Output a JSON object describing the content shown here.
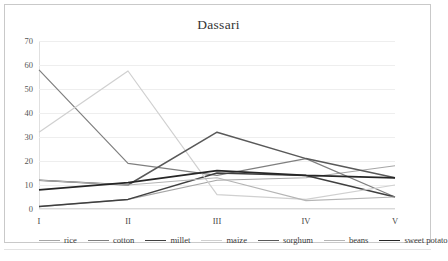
{
  "chart_data": {
    "type": "line",
    "title": "Dassari",
    "xlabel": "",
    "ylabel": "",
    "categories": [
      "I",
      "II",
      "III",
      "IV",
      "V"
    ],
    "ylim": [
      0,
      70
    ],
    "yticks": [
      0,
      10,
      20,
      30,
      40,
      50,
      60,
      70
    ],
    "grid": true,
    "legend_position": "bottom",
    "series": [
      {
        "name": "rice",
        "color": "#a6a6a6",
        "width": 1.1,
        "values": [
          1,
          4,
          12,
          13,
          18
        ]
      },
      {
        "name": "cotton",
        "color": "#7f7f7f",
        "width": 1.2,
        "values": [
          58,
          19,
          14,
          21,
          5
        ]
      },
      {
        "name": "millet",
        "color": "#404040",
        "width": 1.5,
        "values": [
          1,
          4,
          15,
          14,
          5
        ]
      },
      {
        "name": "maize",
        "color": "#d0d0d0",
        "width": 1.2,
        "values": [
          32,
          57.5,
          6,
          4,
          10
        ]
      },
      {
        "name": "sorghum",
        "color": "#595959",
        "width": 1.5,
        "values": [
          12,
          10,
          32,
          21,
          13
        ]
      },
      {
        "name": "beans",
        "color": "#b5b5b5",
        "width": 1.1,
        "values": [
          12,
          10,
          13,
          3.5,
          5
        ]
      },
      {
        "name": "sweet potato",
        "color": "#262626",
        "width": 1.7,
        "values": [
          8,
          11,
          16,
          14,
          13
        ]
      }
    ]
  },
  "legend": {
    "items": [
      "rice",
      "cotton",
      "millet",
      "maize",
      "sorghum",
      "beans",
      "sweet potato"
    ]
  },
  "colors": {
    "background": "#ffffff",
    "card_border": "#c9c9c9",
    "gridline": "#eeeeee",
    "axis_text": "#555555",
    "title_text": "#333333"
  }
}
